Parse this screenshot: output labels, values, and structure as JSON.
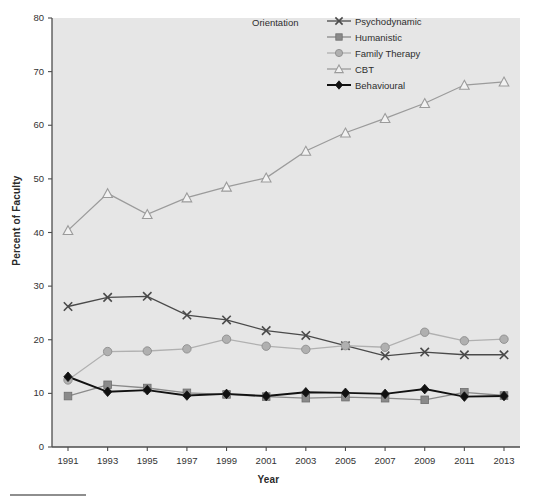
{
  "chart_data": {
    "type": "line",
    "title": "",
    "xlabel": "Year",
    "ylabel": "Percent of Faculty",
    "legend_title": "Orientation",
    "legend_position": "top-right-inside",
    "grid": false,
    "xlim": [
      1990,
      2014
    ],
    "ylim": [
      0,
      80
    ],
    "ytick_step": 10,
    "yticks": [
      0,
      10,
      20,
      30,
      40,
      50,
      60,
      70,
      80
    ],
    "categories": [
      1991,
      1993,
      1995,
      1997,
      1999,
      2001,
      2003,
      2005,
      2007,
      2009,
      2011,
      2013
    ],
    "xticks": [
      "1991",
      "1993",
      "1995",
      "1997",
      "1999",
      "2001",
      "2003",
      "2005",
      "2007",
      "2009",
      "2011",
      "2013"
    ],
    "series": [
      {
        "name": "Psychodynamic",
        "marker": "x",
        "color": "#4a4a4a",
        "values": [
          26.2,
          27.9,
          28.1,
          24.6,
          23.7,
          21.7,
          20.8,
          18.9,
          17.0,
          17.7,
          17.2,
          17.2
        ]
      },
      {
        "name": "Humanistic",
        "marker": "square",
        "color": "#8a8a8a",
        "values": [
          9.5,
          11.6,
          11.0,
          10.1,
          9.8,
          9.4,
          9.1,
          9.3,
          9.1,
          8.8,
          10.2,
          9.6
        ]
      },
      {
        "name": "Family Therapy",
        "marker": "circle",
        "color": "#b0b0b0",
        "values": [
          12.5,
          17.8,
          17.9,
          18.3,
          20.1,
          18.8,
          18.2,
          18.9,
          18.6,
          21.4,
          19.8,
          20.1
        ]
      },
      {
        "name": "CBT",
        "marker": "triangle",
        "color": "#9b9b9b",
        "values": [
          40.4,
          47.3,
          43.4,
          46.5,
          48.5,
          50.2,
          55.2,
          58.6,
          61.3,
          64.1,
          67.5,
          68.1
        ]
      },
      {
        "name": "Behavioural",
        "marker": "diamond",
        "color": "#111111",
        "values": [
          13.1,
          10.3,
          10.6,
          9.6,
          9.9,
          9.5,
          10.2,
          10.1,
          9.9,
          10.8,
          9.4,
          9.5
        ]
      }
    ]
  },
  "plot": {
    "background_color": "#e6e6e6",
    "axis_color": "#4d4d4d"
  }
}
